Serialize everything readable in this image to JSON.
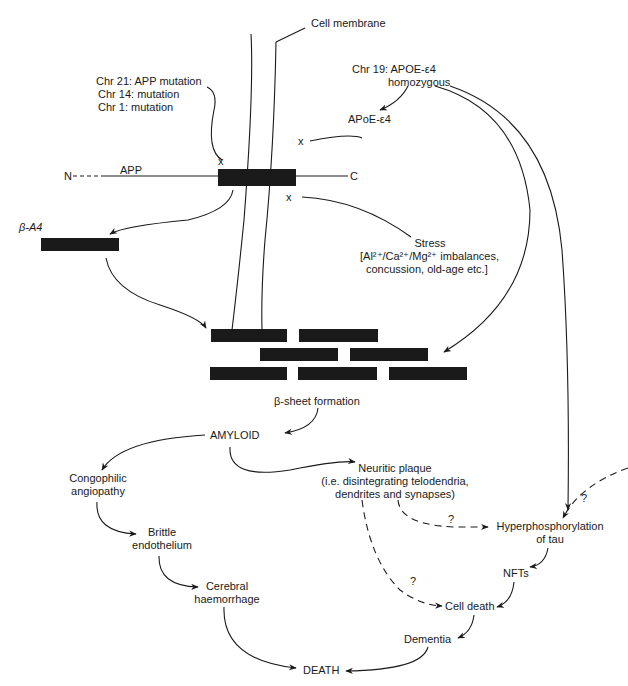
{
  "diagram": {
    "labels": {
      "cell_membrane": "Cell membrane",
      "chr21": "Chr 21: APP mutation",
      "chr14": "Chr 14: mutation",
      "chr1": "Chr 1: mutation",
      "chr19_line1": "Chr 19: APOE-ε4",
      "chr19_line2": "homozygous",
      "apoe": "APoE-ε4",
      "app": "APP",
      "n_term": "N",
      "c_term": "C",
      "mark_x": "x",
      "beta_a4": "β-A4",
      "stress": "Stress",
      "stress_line1": "[Al²⁺/Ca²⁺/Mg²⁺ imbalances,",
      "stress_line2": "concussion, old-age etc.]",
      "beta_sheet": "β-sheet formation",
      "amyloid": "AMYLOID",
      "congophilic_1": "Congophilic",
      "congophilic_2": "angiopathy",
      "brittle_1": "Brittle",
      "brittle_2": "endothelium",
      "cerebral_1": "Cerebral",
      "cerebral_2": "haemorrhage",
      "neuritic_1": "Neuritic plaque",
      "neuritic_2": "(i.e. disintegrating telodendria,",
      "neuritic_3": "dendrites and synapses)",
      "hyper_1": "Hyperphosphorylation",
      "hyper_2": "of tau",
      "nfts": "NFTs",
      "cell_death": "Cell death",
      "dementia": "Dementia",
      "death": "DEATH",
      "question": "?"
    },
    "colors": {
      "ink": "#1a1a1a",
      "background": "#ffffff"
    }
  }
}
